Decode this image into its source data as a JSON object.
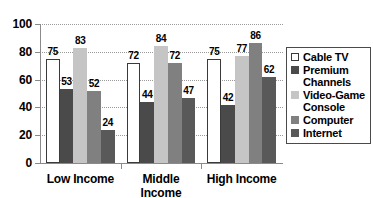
{
  "chart_data": {
    "type": "bar",
    "title": "",
    "subtitle": "",
    "xlabel": "",
    "ylabel": "",
    "categories": [
      "Low Income",
      "Middle Income",
      "High Income"
    ],
    "series": [
      {
        "name": "Cable TV",
        "color": "#ffffff",
        "values": [
          75,
          72,
          75
        ]
      },
      {
        "name": "Premium Channels",
        "color": "#4a4a4a",
        "values": [
          53,
          44,
          42
        ]
      },
      {
        "name": "Video-Game Console",
        "color": "#c5c5c5",
        "values": [
          83,
          84,
          77
        ]
      },
      {
        "name": "Computer",
        "color": "#808080",
        "values": [
          52,
          72,
          86
        ]
      },
      {
        "name": "Internet",
        "color": "#595959",
        "values": [
          24,
          47,
          62
        ]
      }
    ],
    "ylim": [
      0,
      100
    ],
    "yticks": [
      0,
      20,
      40,
      60,
      80,
      100
    ],
    "ytick_labels": [
      "0",
      "20",
      "40",
      "60",
      "80",
      "100"
    ],
    "grid": true,
    "grid_axis": "y",
    "grid_style": "dotted",
    "legend_position": "right",
    "data_labels": true,
    "legend_entries": [
      {
        "label": "Cable TV"
      },
      {
        "label": "Premium Channels"
      },
      {
        "label": "Video-Game Console"
      },
      {
        "label": "Computer"
      },
      {
        "label": "Internet"
      }
    ]
  }
}
